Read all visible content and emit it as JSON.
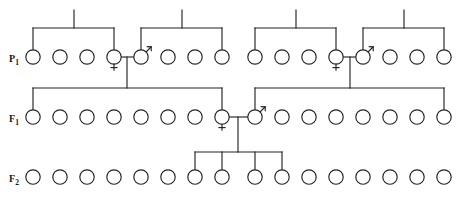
{
  "figure": {
    "kind": "pedigree-chart",
    "type": "genetics-cross-diagram",
    "background": "#ffffff",
    "line_color": "#232326",
    "symbol_fill": "#ffffff",
    "width": 461,
    "height": 201
  },
  "generations": [
    {
      "id": "P1",
      "label": "P",
      "subscript": "1",
      "label_x": 14,
      "label_y": 62,
      "row_y": 57,
      "radius": 7.2,
      "count": 16,
      "individuals": [
        {
          "index": 1,
          "cx": 33,
          "sex": "unknown"
        },
        {
          "index": 2,
          "cx": 60,
          "sex": "unknown"
        },
        {
          "index": 3,
          "cx": 87,
          "sex": "unknown"
        },
        {
          "index": 4,
          "cx": 114,
          "sex": "female"
        },
        {
          "index": 5,
          "cx": 141,
          "sex": "male"
        },
        {
          "index": 6,
          "cx": 168,
          "sex": "unknown"
        },
        {
          "index": 7,
          "cx": 195,
          "sex": "unknown"
        },
        {
          "index": 8,
          "cx": 222,
          "sex": "unknown"
        },
        {
          "index": 9,
          "cx": 255,
          "sex": "unknown"
        },
        {
          "index": 10,
          "cx": 282,
          "sex": "unknown"
        },
        {
          "index": 11,
          "cx": 309,
          "sex": "unknown"
        },
        {
          "index": 12,
          "cx": 336,
          "sex": "female"
        },
        {
          "index": 13,
          "cx": 363,
          "sex": "male"
        },
        {
          "index": 14,
          "cx": 390,
          "sex": "unknown"
        },
        {
          "index": 15,
          "cx": 417,
          "sex": "unknown"
        },
        {
          "index": 16,
          "cx": 444,
          "sex": "unknown"
        }
      ],
      "sibships": [
        {
          "id": "p1-sib-a",
          "bar_y": 28,
          "left_x": 33,
          "right_x": 114,
          "stub_x": 74,
          "stub_top": 10,
          "drops": [
            33,
            114
          ]
        },
        {
          "id": "p1-sib-b",
          "bar_y": 28,
          "left_x": 141,
          "right_x": 222,
          "stub_x": 182,
          "stub_top": 10,
          "drops": [
            141,
            222
          ]
        },
        {
          "id": "p1-sib-c",
          "bar_y": 28,
          "left_x": 255,
          "right_x": 336,
          "stub_x": 296,
          "stub_top": 10,
          "drops": [
            255,
            336
          ]
        },
        {
          "id": "p1-sib-d",
          "bar_y": 28,
          "left_x": 363,
          "right_x": 444,
          "stub_x": 404,
          "stub_top": 10,
          "drops": [
            363,
            444
          ]
        }
      ],
      "matings": [
        {
          "id": "p1-mating-left",
          "female_cx": 114,
          "male_cx": 141,
          "line_y": 57,
          "descent_x": 127,
          "descent_to": 88
        },
        {
          "id": "p1-mating-right",
          "female_cx": 336,
          "male_cx": 363,
          "line_y": 57,
          "descent_x": 350,
          "descent_to": 88
        }
      ]
    },
    {
      "id": "F1",
      "label": "F",
      "subscript": "1",
      "label_x": 14,
      "label_y": 122,
      "row_y": 117,
      "radius": 7.2,
      "count": 16,
      "individuals": [
        {
          "index": 1,
          "cx": 33,
          "sex": "unknown"
        },
        {
          "index": 2,
          "cx": 60,
          "sex": "unknown"
        },
        {
          "index": 3,
          "cx": 87,
          "sex": "unknown"
        },
        {
          "index": 4,
          "cx": 114,
          "sex": "unknown"
        },
        {
          "index": 5,
          "cx": 141,
          "sex": "unknown"
        },
        {
          "index": 6,
          "cx": 168,
          "sex": "unknown"
        },
        {
          "index": 7,
          "cx": 195,
          "sex": "unknown"
        },
        {
          "index": 8,
          "cx": 222,
          "sex": "female"
        },
        {
          "index": 9,
          "cx": 255,
          "sex": "male"
        },
        {
          "index": 10,
          "cx": 282,
          "sex": "unknown"
        },
        {
          "index": 11,
          "cx": 309,
          "sex": "unknown"
        },
        {
          "index": 12,
          "cx": 336,
          "sex": "unknown"
        },
        {
          "index": 13,
          "cx": 363,
          "sex": "unknown"
        },
        {
          "index": 14,
          "cx": 390,
          "sex": "unknown"
        },
        {
          "index": 15,
          "cx": 417,
          "sex": "unknown"
        },
        {
          "index": 16,
          "cx": 444,
          "sex": "unknown"
        }
      ],
      "sibships": [
        {
          "id": "f1-sib-left",
          "bar_y": 88,
          "left_x": 33,
          "right_x": 222,
          "stub_x": 127,
          "drops": [
            33,
            222
          ]
        },
        {
          "id": "f1-sib-right",
          "bar_y": 88,
          "left_x": 255,
          "right_x": 444,
          "stub_x": 350,
          "drops": [
            255,
            444
          ]
        }
      ],
      "matings": [
        {
          "id": "f1-mating",
          "female_cx": 222,
          "male_cx": 255,
          "line_y": 117,
          "descent_x": 238,
          "descent_to": 152
        }
      ]
    },
    {
      "id": "F2",
      "label": "F",
      "subscript": "2",
      "label_x": 14,
      "label_y": 182,
      "row_y": 177,
      "radius": 7.2,
      "count": 16,
      "individuals": [
        {
          "index": 1,
          "cx": 33,
          "sex": "unknown"
        },
        {
          "index": 2,
          "cx": 60,
          "sex": "unknown"
        },
        {
          "index": 3,
          "cx": 87,
          "sex": "unknown"
        },
        {
          "index": 4,
          "cx": 114,
          "sex": "unknown"
        },
        {
          "index": 5,
          "cx": 141,
          "sex": "unknown"
        },
        {
          "index": 6,
          "cx": 168,
          "sex": "unknown"
        },
        {
          "index": 7,
          "cx": 195,
          "sex": "unknown"
        },
        {
          "index": 8,
          "cx": 222,
          "sex": "unknown"
        },
        {
          "index": 9,
          "cx": 255,
          "sex": "unknown"
        },
        {
          "index": 10,
          "cx": 282,
          "sex": "unknown"
        },
        {
          "index": 11,
          "cx": 309,
          "sex": "unknown"
        },
        {
          "index": 12,
          "cx": 336,
          "sex": "unknown"
        },
        {
          "index": 13,
          "cx": 363,
          "sex": "unknown"
        },
        {
          "index": 14,
          "cx": 390,
          "sex": "unknown"
        },
        {
          "index": 15,
          "cx": 417,
          "sex": "unknown"
        },
        {
          "index": 16,
          "cx": 444,
          "sex": "unknown"
        }
      ],
      "sibships": [
        {
          "id": "f2-sib",
          "bar_y": 152,
          "left_x": 195,
          "right_x": 282,
          "stub_x": 238,
          "drops": [
            195,
            222,
            255,
            282
          ]
        }
      ],
      "matings": []
    }
  ]
}
